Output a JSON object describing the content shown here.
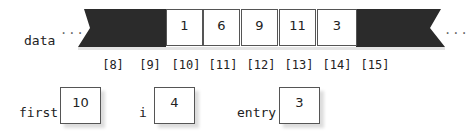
{
  "array": {
    "name": "data",
    "ellipsis": "...",
    "cells": [
      {
        "index": "[8]",
        "value": "",
        "shaded": true
      },
      {
        "index": "[9]",
        "value": "",
        "shaded": true
      },
      {
        "index": "[10]",
        "value": "1",
        "shaded": false
      },
      {
        "index": "[11]",
        "value": "6",
        "shaded": false
      },
      {
        "index": "[12]",
        "value": "9",
        "shaded": false
      },
      {
        "index": "[13]",
        "value": "11",
        "shaded": false
      },
      {
        "index": "[14]",
        "value": "3",
        "shaded": false
      },
      {
        "index": "[15]",
        "value": "",
        "shaded": true
      }
    ]
  },
  "variables": [
    {
      "name": "first",
      "value": "10"
    },
    {
      "name": "i",
      "value": "4"
    },
    {
      "name": "entry",
      "value": "3"
    }
  ],
  "colors": {
    "shaded": "#2b2b2b",
    "border": "#555555"
  }
}
